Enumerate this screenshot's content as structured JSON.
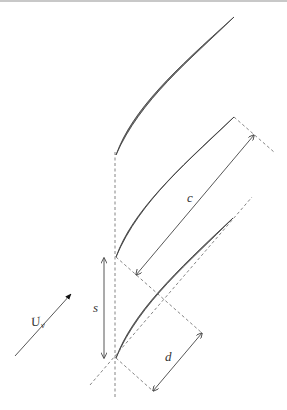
{
  "diagram": {
    "colors": {
      "blade_fill": "#7a7a7a",
      "blade_stroke": "#3a3a3a",
      "line": "#444444",
      "dashed": "#777777",
      "label": "#333333"
    },
    "labels": {
      "velocity": "U",
      "velocity_subscript": "v",
      "chord": "c",
      "spacing": "s",
      "throat": "d"
    },
    "blades": [
      {
        "name": "blade-top",
        "leading_edge": [
          116,
          155
        ],
        "trailing_edge": [
          234,
          17
        ]
      },
      {
        "name": "blade-middle",
        "leading_edge": [
          116,
          257
        ],
        "trailing_edge": [
          234,
          117
        ]
      },
      {
        "name": "blade-bottom",
        "leading_edge": [
          116,
          358
        ],
        "trailing_edge": [
          233,
          218
        ]
      }
    ],
    "dimensions": [
      {
        "name": "chord",
        "label": "c",
        "from": [
          136,
          275
        ],
        "to": [
          254,
          135
        ]
      },
      {
        "name": "spacing",
        "label": "s",
        "from": [
          104,
          258
        ],
        "to": [
          104,
          358
        ]
      },
      {
        "name": "throat",
        "label": "d",
        "from": [
          153,
          391
        ],
        "to": [
          202,
          333
        ]
      }
    ],
    "inflow_arrow": {
      "label": "U",
      "subscript": "v",
      "from": [
        15,
        356
      ],
      "to": [
        72,
        293
      ]
    }
  }
}
